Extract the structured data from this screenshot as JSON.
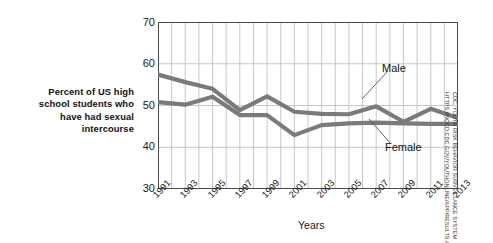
{
  "caption": {
    "lines": [
      "Percent of US high",
      "school students who",
      "have had sexual",
      "intercourse"
    ]
  },
  "credit": {
    "line1": "CDC, YOUTH RISK BEHAVIOR SURVEILLANCE SYSTEM",
    "line2": "HTTPS://NCCD.CDC.GOV/YOUTHONLINE/APP/RESULTS.ASPX?"
  },
  "chart_data": {
    "type": "line",
    "title": "",
    "xlabel": "Years",
    "ylabel": "Percent of US high school students who have had sexual intercourse",
    "xlim": [
      1991,
      2013
    ],
    "ylim": [
      30,
      70
    ],
    "yticks": [
      30,
      40,
      50,
      60,
      70
    ],
    "ytick_labels": [
      "30",
      "40",
      "50",
      "60",
      "70"
    ],
    "xticks": [
      1991,
      1993,
      1995,
      1997,
      1999,
      2001,
      2003,
      2005,
      2007,
      2009,
      2011,
      2013
    ],
    "xtick_labels": [
      "1991",
      "1993",
      "1995",
      "1997",
      "1999",
      "2001",
      "2003",
      "2005",
      "2007",
      "2009",
      "2011",
      "2013"
    ],
    "grid": "vertical gridlines every year, horizontal gridlines at each y tick",
    "legend_position": "inline annotations on plot",
    "x": [
      1991,
      1993,
      1995,
      1997,
      1999,
      2001,
      2003,
      2005,
      2007,
      2009,
      2011,
      2013
    ],
    "series": [
      {
        "name": "Male",
        "color": "#7a7a7a",
        "label_text": "Male",
        "values": [
          57.4,
          55.6,
          54.0,
          48.9,
          52.2,
          48.5,
          48.0,
          47.9,
          49.8,
          46.1,
          49.2,
          47.0
        ]
      },
      {
        "name": "Female",
        "color": "#7a7a7a",
        "label_text": "Female",
        "values": [
          50.8,
          50.2,
          52.1,
          47.7,
          47.7,
          42.9,
          45.3,
          45.7,
          45.9,
          45.7,
          45.6,
          45.6
        ]
      }
    ]
  }
}
